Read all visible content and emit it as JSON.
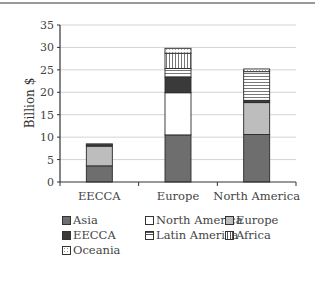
{
  "chart_data": {
    "type": "bar",
    "stacked": true,
    "title": "",
    "xlabel": "",
    "ylabel": "Billion $",
    "ylim": [
      0,
      35
    ],
    "yticks": [
      0,
      5,
      10,
      15,
      20,
      25,
      30,
      35
    ],
    "grid": true,
    "legend_position": "bottom",
    "categories": [
      "EECCA",
      "Europe",
      "North America"
    ],
    "series": [
      {
        "name": "Asia",
        "fill": "#6e6e6e",
        "pattern": "solid",
        "values": [
          3.6,
          10.5,
          10.6
        ]
      },
      {
        "name": "North America",
        "fill": "#ffffff",
        "pattern": "solid",
        "values": [
          0.0,
          9.4,
          0.0
        ]
      },
      {
        "name": "Europe",
        "fill": "#bdbdbd",
        "pattern": "solid",
        "values": [
          4.4,
          0.0,
          7.1
        ]
      },
      {
        "name": "EECCA",
        "fill": "#3a3a3a",
        "pattern": "solid",
        "values": [
          0.4,
          3.4,
          0.5
        ]
      },
      {
        "name": "Latin America",
        "fill": "#ffffff",
        "pattern": "horizontal",
        "values": [
          0.0,
          2.0,
          6.4
        ]
      },
      {
        "name": "Africa",
        "fill": "#ffffff",
        "pattern": "vertical",
        "values": [
          0.0,
          3.4,
          0.0
        ]
      },
      {
        "name": "Oceania",
        "fill": "#ffffff",
        "pattern": "dotted",
        "values": [
          0.1,
          1.1,
          0.6
        ]
      }
    ],
    "stack_order": [
      "Asia",
      "North America",
      "Europe",
      "EECCA",
      "Latin America",
      "Africa",
      "Oceania"
    ]
  },
  "legend": [
    {
      "label": "Asia",
      "pattern": "solid",
      "fill": "#6e6e6e"
    },
    {
      "label": "North America",
      "pattern": "solid",
      "fill": "#ffffff"
    },
    {
      "label": "Europe",
      "pattern": "solid",
      "fill": "#bdbdbd"
    },
    {
      "label": "EECCA",
      "pattern": "solid",
      "fill": "#3a3a3a"
    },
    {
      "label": "Latin America",
      "pattern": "horizontal",
      "fill": "#ffffff"
    },
    {
      "label": "Africa",
      "pattern": "vertical",
      "fill": "#ffffff"
    },
    {
      "label": "Oceania",
      "pattern": "dotted",
      "fill": "#ffffff"
    }
  ]
}
